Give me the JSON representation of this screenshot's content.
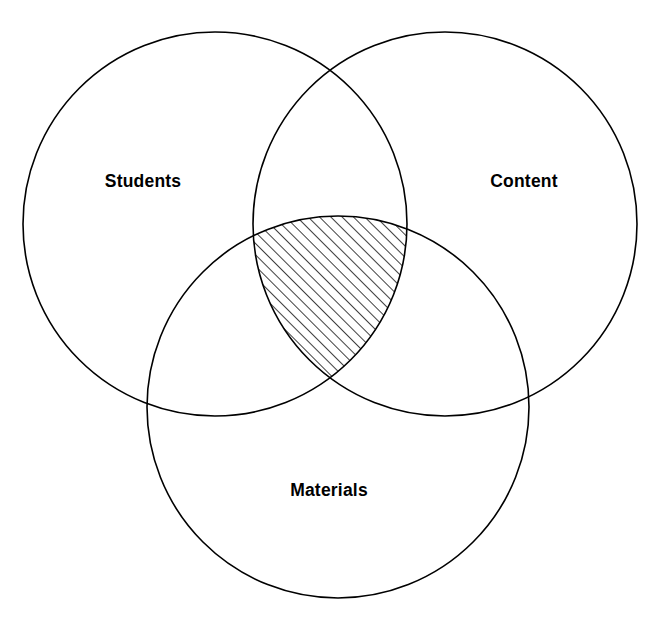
{
  "diagram": {
    "type": "venn-3-circle",
    "title": "",
    "background_color": "#ffffff",
    "stroke_color": "#000000",
    "stroke_width": 1.6,
    "canvas": {
      "width": 670,
      "height": 629
    },
    "sets": [
      {
        "id": "students",
        "label": "Students",
        "label_x": 143,
        "label_y": 187,
        "cx": 215,
        "cy": 224,
        "r": 192,
        "fill": "none"
      },
      {
        "id": "content",
        "label": "Content",
        "label_x": 524,
        "label_y": 187,
        "cx": 445,
        "cy": 224,
        "r": 192,
        "fill": "none"
      },
      {
        "id": "materials",
        "label": "Materials",
        "label_x": 329,
        "label_y": 496,
        "cx": 338,
        "cy": 407,
        "r": 191,
        "fill": "none"
      }
    ],
    "highlight": {
      "id": "triple-intersection",
      "description": "Students ∩ Content ∩ Materials",
      "fill_pattern": "diagonal-hatch",
      "hatch_angle_deg": 45,
      "hatch_spacing": 8,
      "hatch_stroke_width": 1.5,
      "hatch_color": "#000000",
      "members": [
        "students",
        "content",
        "materials"
      ]
    }
  },
  "chart_data": {
    "type": "venn",
    "title": "",
    "set_labels": [
      "Students",
      "Content",
      "Materials"
    ],
    "regions": [
      {
        "sets": [
          "Students"
        ],
        "shaded": false
      },
      {
        "sets": [
          "Content"
        ],
        "shaded": false
      },
      {
        "sets": [
          "Materials"
        ],
        "shaded": false
      },
      {
        "sets": [
          "Students",
          "Content"
        ],
        "shaded": false
      },
      {
        "sets": [
          "Students",
          "Materials"
        ],
        "shaded": false
      },
      {
        "sets": [
          "Content",
          "Materials"
        ],
        "shaded": false
      },
      {
        "sets": [
          "Students",
          "Content",
          "Materials"
        ],
        "shaded": true
      }
    ],
    "legend": []
  }
}
